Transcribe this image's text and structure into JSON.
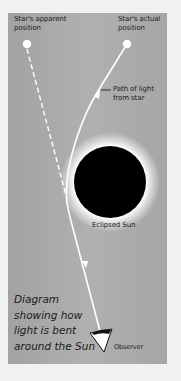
{
  "diagram": {
    "labels": {
      "apparent_position": "Star's apparent\nposition",
      "actual_position": "Star's actual\nposition",
      "path_of_light": "Path of light\nfrom star",
      "eclipsed_sun": "Eclipsed Sun",
      "observer": "Observer"
    },
    "caption": "Diagram\nshowing how\nlight is bent\naround the Sun",
    "colors": {
      "page_background": "#f1f1f1",
      "panel_background": "#aaaaaa",
      "light_path": "#ffffff",
      "sun": "#000000",
      "corona": "#ffffff",
      "text": "#222222"
    }
  }
}
